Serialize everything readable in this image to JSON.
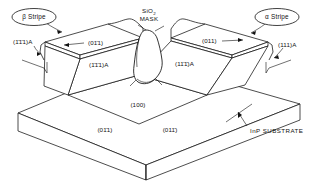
{
  "figure": {
    "background_color": "#ffffff",
    "line_color": "#111111",
    "projection": "isometric"
  },
  "callouts": {
    "beta_stripe": "β Stripe",
    "alpha_stripe": "α Stripe",
    "mask_line1": "SiO",
    "mask_subscript": "2",
    "mask_line2": "MASK"
  },
  "plane_labels": {
    "left_outer_sidewall": "(1̄1̄1)A",
    "left_top_face": "(01̄1)",
    "left_inner_sidewall": "(1̄1̄1)A",
    "right_top_face": "(011)",
    "right_outer_sidewall": "(111)A",
    "right_inner_sidewall": "(11̄1̄)A",
    "etch_floor": "(100)",
    "front_left_face": "(01̄1)",
    "front_right_face": "(011̄)"
  },
  "substrate": {
    "label": "InP SUBSTRATE"
  }
}
